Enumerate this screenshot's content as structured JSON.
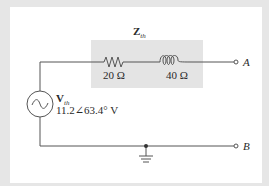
{
  "diagram": {
    "type": "thevenin-equivalent-circuit",
    "thevenin_impedance": {
      "label_main": "Z",
      "label_sub": "th",
      "resistor": {
        "value": "20 Ω"
      },
      "inductor": {
        "value": "40 Ω"
      }
    },
    "thevenin_source": {
      "label_main": "V",
      "label_sub": "th",
      "value": "11.2∠63.4° V",
      "symbol": "ac-source-icon"
    },
    "terminals": {
      "a": "A",
      "b": "B"
    },
    "ground": "ground-icon",
    "colors": {
      "wire": "#555555",
      "shaded_box": "#e4e4e4",
      "background": "#e6e6e6",
      "panel": "#ffffff"
    }
  }
}
